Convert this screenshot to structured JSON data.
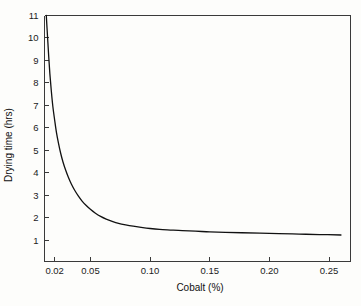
{
  "chart_data": {
    "type": "line",
    "title": "",
    "xlabel": "Cobalt (%)",
    "ylabel": "Drying time (hrs)",
    "xlim": [
      0.0115,
      0.268
    ],
    "ylim": [
      0.05,
      11
    ],
    "grid": false,
    "legend": null,
    "xticks": [
      0.02,
      0.05,
      0.1,
      0.15,
      0.2,
      0.25
    ],
    "xticklabels": [
      "0.02",
      "0.05",
      "0.10",
      "0.15",
      "0.20",
      "0.25"
    ],
    "yticks": [
      1,
      2,
      3,
      4,
      5,
      6,
      7,
      8,
      9,
      10,
      11
    ],
    "yticklabels": [
      "1",
      "2",
      "3",
      "4",
      "5",
      "6",
      "7",
      "8",
      "9",
      "10",
      "11"
    ],
    "series": [
      {
        "name": "Drying time vs cobalt",
        "color": "#111111",
        "x": [
          0.013,
          0.014,
          0.015,
          0.016,
          0.0172,
          0.0185,
          0.02,
          0.0215,
          0.0232,
          0.025,
          0.027,
          0.0292,
          0.0315,
          0.034,
          0.0368,
          0.0398,
          0.043,
          0.0465,
          0.0502,
          0.0542,
          0.0585,
          0.0632,
          0.0682,
          0.0736,
          0.0795,
          0.0858,
          0.0925,
          0.1,
          0.108,
          0.117,
          0.127,
          0.138,
          0.15,
          0.163,
          0.177,
          0.192,
          0.208,
          0.225,
          0.242,
          0.26
        ],
        "y": [
          11.0,
          10.1,
          9.2,
          8.4,
          7.65,
          6.95,
          6.35,
          5.8,
          5.32,
          4.88,
          4.48,
          4.12,
          3.8,
          3.5,
          3.22,
          2.97,
          2.74,
          2.54,
          2.36,
          2.2,
          2.06,
          1.94,
          1.84,
          1.75,
          1.68,
          1.62,
          1.57,
          1.52,
          1.48,
          1.45,
          1.42,
          1.4,
          1.37,
          1.35,
          1.33,
          1.31,
          1.29,
          1.27,
          1.25,
          1.23
        ]
      }
    ]
  },
  "axes": {
    "x_title": "Cobalt (%)",
    "y_title": "Drying time (hrs)"
  }
}
